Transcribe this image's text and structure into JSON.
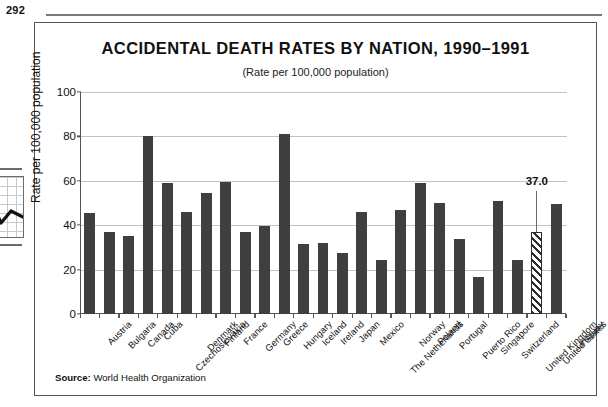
{
  "page": {
    "number": "292"
  },
  "figure": {
    "title": "ACCIDENTAL DEATH RATES BY NATION, 1990–1991",
    "subtitle": "(Rate per 100,000 population)",
    "source_label": "Source:",
    "source_text": "World Health Organization",
    "bar_color": "#3f3f3f",
    "highlight_color": "#2e2e2e",
    "frame_color": "#555555",
    "grid_color": "#c2c2c2"
  },
  "callout": {
    "value_label": "37.0",
    "target_category": "United States"
  },
  "chart_data": {
    "type": "bar",
    "title": "ACCIDENTAL DEATH RATES BY NATION, 1990–1991",
    "subtitle": "(Rate per 100,000 population)",
    "xlabel": "",
    "ylabel": "Rate per 100,000 population",
    "ylim": [
      0,
      100
    ],
    "yticks": [
      0,
      20,
      40,
      60,
      80,
      100
    ],
    "ytick_labels": [
      "0",
      "20",
      "40",
      "60",
      "80",
      "100"
    ],
    "grid": true,
    "grid_axis": "y",
    "legend": false,
    "highlighted_category": "United States",
    "highlight_style": "diagonal-hatch",
    "annotations": [
      {
        "category": "United States",
        "text": "37.0",
        "value": 37.0
      }
    ],
    "categories": [
      "Austria",
      "Bulgaria",
      "Canada",
      "Cuba",
      "Czechoslovakia",
      "Denmark",
      "Finland",
      "France",
      "Germany",
      "Greece",
      "Hungary",
      "Iceland",
      "Ireland",
      "Japan",
      "Mexico",
      "The Netherlands",
      "Norway",
      "Poland",
      "Portugal",
      "Puerto Rico",
      "Singapore",
      "Switzerland",
      "United Kingdom",
      "United States",
      "Uruguay"
    ],
    "values": [
      45.5,
      37.0,
      35.0,
      80.0,
      59.0,
      46.0,
      54.5,
      59.5,
      37.0,
      39.5,
      81.0,
      31.5,
      32.0,
      27.5,
      46.0,
      24.5,
      47.0,
      59.0,
      50.0,
      34.0,
      16.5,
      51.0,
      24.5,
      37.0,
      49.5
    ]
  }
}
